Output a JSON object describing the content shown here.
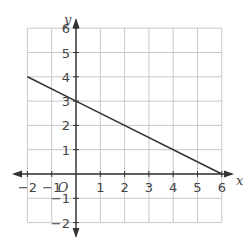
{
  "chart_data": {
    "type": "line",
    "title": "",
    "xlabel": "x",
    "ylabel": "y",
    "xlim": [
      -2,
      6
    ],
    "ylim": [
      -2,
      6
    ],
    "grid": true,
    "origin_label": "O",
    "x_ticks": [
      "−2",
      "−1",
      "1",
      "2",
      "3",
      "4",
      "5",
      "6"
    ],
    "y_ticks": [
      "6",
      "5",
      "4",
      "3",
      "2",
      "1",
      "−1",
      "−2"
    ],
    "series": [
      {
        "name": "line",
        "x": [
          -2,
          0,
          6
        ],
        "y": [
          4,
          3,
          0
        ],
        "color": "#333333"
      }
    ],
    "colors": {
      "grid": "#c8c8c8",
      "axis": "#333333",
      "line": "#333333"
    }
  }
}
